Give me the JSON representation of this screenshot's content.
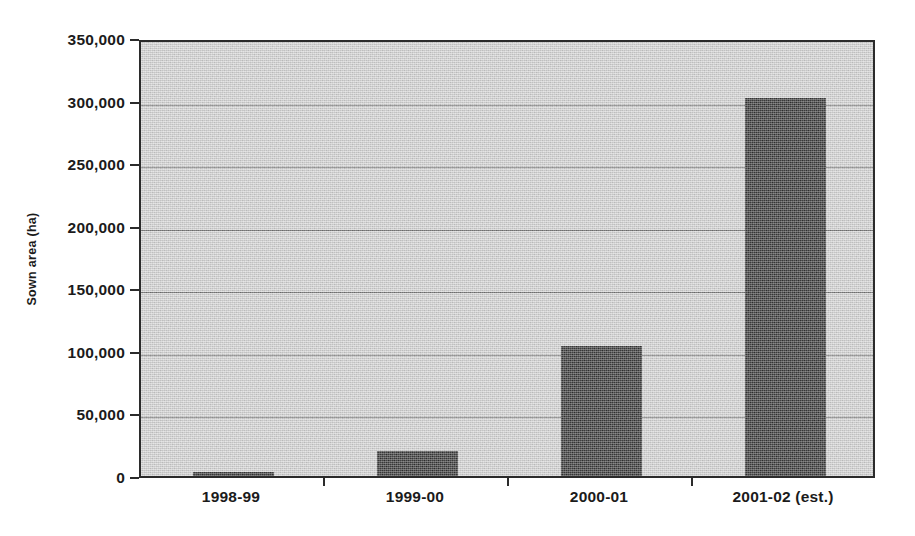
{
  "chart_data": {
    "type": "bar",
    "title": "",
    "xlabel": "",
    "ylabel": "Sown area (ha)",
    "categories": [
      "1998-99",
      "1999-00",
      "2000-01",
      "2001-02 (est.)"
    ],
    "values": [
      3000,
      20000,
      104000,
      302000
    ],
    "series": [
      {
        "name": "Sown area",
        "values": [
          3000,
          20000,
          104000,
          302000
        ]
      }
    ],
    "ylim": [
      0,
      350000
    ],
    "ytick_values": [
      0,
      50000,
      100000,
      150000,
      200000,
      250000,
      300000,
      350000
    ],
    "ytick_labels": [
      "0",
      "50,000",
      "100,000",
      "150,000",
      "200,000",
      "250,000",
      "300,000",
      "350,000"
    ],
    "grid": true,
    "grid_axis": "y",
    "legend": false,
    "legend_position": "none",
    "bar_color": "#161616",
    "plot_background_color": "#d2d2d2",
    "axis_color": "#2b2b2b",
    "gridline_color": "#4a4a4a"
  }
}
